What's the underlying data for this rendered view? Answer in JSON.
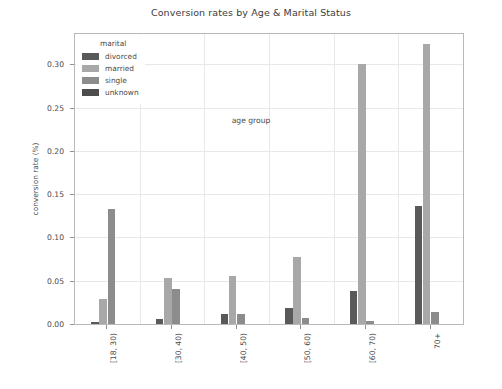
{
  "chart_data": {
    "type": "bar",
    "title": "Conversion rates by Age & Marital Status",
    "xlabel": "age group",
    "ylabel": "conversion rate (%)",
    "categories": [
      "[18, 30)",
      "[30, 40)",
      "[40, 50)",
      "[50, 60)",
      "[60, 70)",
      "70+"
    ],
    "series": [
      {
        "name": "divorced",
        "color": "#595959",
        "values": [
          0.002,
          0.006,
          0.012,
          0.018,
          0.038,
          0.136
        ]
      },
      {
        "name": "married",
        "color": "#a8a8a8",
        "values": [
          0.029,
          0.053,
          0.055,
          0.077,
          0.3,
          0.323
        ]
      },
      {
        "name": "single",
        "color": "#8c8c8c",
        "values": [
          0.133,
          0.04,
          0.011,
          0.007,
          0.003,
          0.014
        ]
      },
      {
        "name": "unknown",
        "color": "#4d4d4d",
        "values": [
          0.0,
          0.0,
          0.0,
          0.0,
          0.0,
          0.0
        ]
      }
    ],
    "ylim": [
      0.0,
      0.335
    ],
    "yticks": [
      0.0,
      0.05,
      0.1,
      0.15,
      0.2,
      0.25,
      0.3
    ],
    "ytick_labels": [
      "0.00",
      "0.05",
      "0.10",
      "0.15",
      "0.20",
      "0.25",
      "0.30"
    ],
    "grid": true,
    "legend_position": "upper left"
  },
  "legend": {
    "title": "marital"
  }
}
